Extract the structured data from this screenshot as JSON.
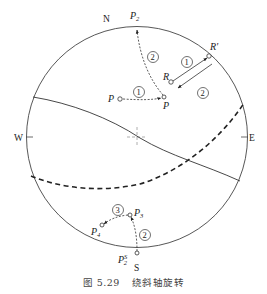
{
  "figure": {
    "caption_number": "图 5.29",
    "caption_title": "绕斜轴旋转",
    "type": "stereonet (equal-area projection)",
    "directions": {
      "north": "N",
      "south": "S",
      "west": "W",
      "east": "E"
    },
    "points": {
      "P": "P",
      "P_rotated": "P",
      "P2": "P",
      "P2_sub": "2",
      "P2S": "P",
      "P2S_sub": "2",
      "P2S_sup": "S",
      "P3": "P",
      "P3_sub": "3",
      "P4": "P",
      "P4_sub": "4",
      "R": "R",
      "R_prime": "R'"
    },
    "steps": {
      "step1_P": "1",
      "step2_P": "2",
      "step1_R": "1",
      "step2_R": "2",
      "step2_bottom": "2",
      "step3_bottom": "3"
    },
    "colors": {
      "line": "#333333",
      "center_cross": "#999999",
      "background": "#ffffff"
    }
  }
}
